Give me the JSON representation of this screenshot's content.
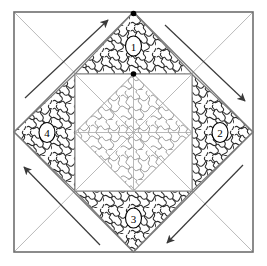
{
  "figure": {
    "type": "origami folding step diagram",
    "canvas": {
      "width": 267,
      "height": 266
    },
    "colors": {
      "background": "#ffffff",
      "frame": "#6e6e6e",
      "crease_light": "#9a9a9a",
      "fold_edge": "#7a7a7a",
      "texture_dark": "#2b2b2b",
      "texture_light": "#8f8f8f",
      "arrow": "#3a3a3a",
      "dot": "#000000",
      "label_fill": "#ffffff",
      "label_stroke": "#000000"
    },
    "frame": {
      "x": 14,
      "y": 12,
      "width": 239,
      "height": 240
    },
    "diamond": {
      "name": "outer-diamond",
      "vertices": [
        {
          "x": 133.5,
          "y": 12
        },
        {
          "x": 253,
          "y": 132
        },
        {
          "x": 133.5,
          "y": 252
        },
        {
          "x": 14,
          "y": 132
        }
      ]
    },
    "inner_square": {
      "x": 75,
      "y": 74,
      "width": 117,
      "height": 117
    },
    "inner_diamond": {
      "name": "inner-diamond",
      "vertices": [
        {
          "x": 133.5,
          "y": 74
        },
        {
          "x": 192,
          "y": 132.5
        },
        {
          "x": 133.5,
          "y": 191
        },
        {
          "x": 75,
          "y": 132.5
        }
      ]
    },
    "flaps": [
      {
        "id": 1,
        "label": "1",
        "position": "top",
        "cx": 133.5,
        "cy": 46,
        "rx": 8,
        "ry": 10
      },
      {
        "id": 2,
        "label": "2",
        "position": "right",
        "cx": 220,
        "cy": 132.5,
        "rx": 8,
        "ry": 10
      },
      {
        "id": 3,
        "label": "3",
        "position": "bottom",
        "cx": 133.5,
        "cy": 218,
        "rx": 8,
        "ry": 10
      },
      {
        "id": 4,
        "label": "4",
        "position": "left",
        "cx": 47,
        "cy": 132.5,
        "rx": 8,
        "ry": 10
      }
    ],
    "dots": [
      {
        "name": "dot-diamond-apex",
        "x": 133.5,
        "y": 13.5,
        "r": 2.8
      },
      {
        "name": "dot-square-apex",
        "x": 133.5,
        "y": 74,
        "r": 2.8
      }
    ],
    "arrows": [
      {
        "name": "arrow-top-left",
        "direction": "up-right",
        "x1": 25,
        "y1": 98,
        "x2": 108,
        "y2": 20
      },
      {
        "name": "arrow-top-right",
        "direction": "down-right",
        "x1": 165,
        "y1": 25,
        "x2": 245,
        "y2": 101
      },
      {
        "name": "arrow-bottom-right",
        "direction": "down-left",
        "x1": 243,
        "y1": 165,
        "x2": 167,
        "y2": 243
      },
      {
        "name": "arrow-bottom-left",
        "direction": "up-left",
        "x1": 100,
        "y1": 245,
        "x2": 24,
        "y2": 167
      }
    ],
    "creases": {
      "description": "full-square diagonals plus horizontal and vertical mid-lines",
      "lines": [
        {
          "name": "diagonal-tl-br",
          "x1": 14,
          "y1": 12,
          "x2": 253,
          "y2": 252
        },
        {
          "name": "diagonal-tr-bl",
          "x1": 253,
          "y1": 12,
          "x2": 14,
          "y2": 252
        },
        {
          "name": "midline-horizontal",
          "x1": 14,
          "y1": 132,
          "x2": 253,
          "y2": 132
        },
        {
          "name": "midline-vertical",
          "x1": 133.5,
          "y1": 12,
          "x2": 133.5,
          "y2": 252
        }
      ]
    }
  }
}
